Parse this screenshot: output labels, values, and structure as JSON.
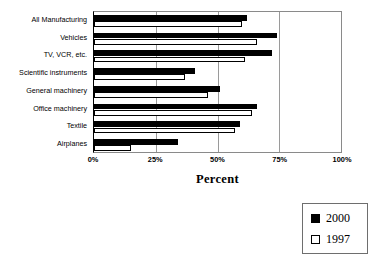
{
  "chart_data": {
    "type": "bar",
    "orientation": "horizontal",
    "title": "",
    "xlabel": "Percent",
    "ylabel": "",
    "xlim": [
      0,
      100
    ],
    "xticks": [
      "0%",
      "25%",
      "50%",
      "75%",
      "100%"
    ],
    "xtick_values": [
      0,
      25,
      50,
      75,
      100
    ],
    "grid": true,
    "grid_axis": "x",
    "legend_position": "bottom-right",
    "categories": [
      "All Manufacturing",
      "Vehicles",
      "TV, VCR, etc.",
      "Scientific instruments",
      "General machinery",
      "Office machinery",
      "Textile",
      "Airplanes"
    ],
    "series": [
      {
        "name": "2000",
        "color": "#000000",
        "values": [
          62,
          74,
          72,
          41,
          51,
          66,
          59,
          34
        ]
      },
      {
        "name": "1997",
        "color": "#ffffff",
        "values": [
          60,
          66,
          61,
          37,
          46,
          64,
          57,
          15
        ]
      }
    ]
  },
  "axis": {
    "title": "Percent"
  },
  "legend": {
    "entries": [
      {
        "label": "2000",
        "swatch": "filled-square"
      },
      {
        "label": "1997",
        "swatch": "open-square"
      }
    ]
  },
  "colors": {
    "series_2000": "#000000",
    "series_1997": "#ffffff",
    "gridline": "#9a9a9a",
    "frame": "#8a8a8a",
    "background": "#ffffff"
  }
}
